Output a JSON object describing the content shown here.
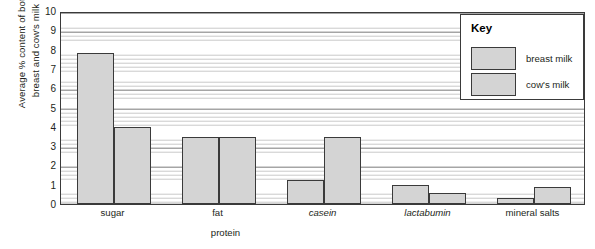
{
  "chart_data": {
    "type": "bar",
    "title": "",
    "subtitle": "",
    "xlabel": "protein",
    "ylabel": "Average % content of both breast and cow's milk",
    "ylabel_line1": "Average % content of both",
    "ylabel_line2": "breast and cow's milk",
    "categories": [
      "sugar",
      "fat",
      "casein",
      "lactabumin",
      "mineral salts"
    ],
    "categories_italic": [
      false,
      false,
      true,
      true,
      false
    ],
    "series": [
      {
        "name": "breast milk",
        "values": [
          7.8,
          3.45,
          1.25,
          1.0,
          0.3
        ],
        "color": "#d4d4d4"
      },
      {
        "name": "cow's milk",
        "values": [
          4.0,
          3.45,
          3.45,
          0.55,
          0.9
        ],
        "color": "#d4d4d4"
      }
    ],
    "ylim": [
      0,
      10
    ],
    "ytick_labels": [
      "10",
      "9",
      "8",
      "7",
      "6",
      "5",
      "4",
      "3",
      "2",
      "1",
      "0"
    ],
    "ytick_values": [
      10,
      9,
      8,
      7,
      6,
      5,
      4,
      3,
      2,
      1,
      0
    ],
    "grid": true,
    "grid_minor_step": 0.2,
    "legend_position": "top-right"
  },
  "legend": {
    "title": "Key",
    "entries": [
      {
        "label": "breast milk"
      },
      {
        "label": "cow's milk"
      }
    ]
  },
  "colors": {
    "bar_fill": "#d4d4d4",
    "bar_border": "#3a3a3a",
    "grid_major": "#8f8f8f",
    "grid_minor": "#c9c9c9",
    "text": "#231f20",
    "background": "#ffffff"
  }
}
